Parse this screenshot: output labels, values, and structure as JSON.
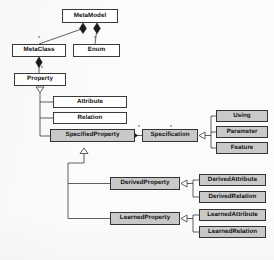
{
  "diagram": {
    "type": "uml-class-diagram",
    "background_color": "#fbfbfb",
    "node_fill_white": "#ffffff",
    "node_fill_gray": "#c9c9c9",
    "line_color": "#3a3a3a",
    "nodes": [
      {
        "id": "metamodel",
        "label": "MetaModel",
        "fill": "white",
        "x": 62,
        "y": 9,
        "w": 56,
        "h": 14
      },
      {
        "id": "metaclass",
        "label": "MetaClass",
        "fill": "white",
        "x": 12,
        "y": 44,
        "w": 54,
        "h": 13
      },
      {
        "id": "enum",
        "label": "Enum",
        "fill": "white",
        "x": 73,
        "y": 44,
        "w": 47,
        "h": 13
      },
      {
        "id": "property",
        "label": "Property",
        "fill": "white",
        "x": 14,
        "y": 73,
        "w": 52,
        "h": 13
      },
      {
        "id": "attribute",
        "label": "Attribute",
        "fill": "white",
        "x": 53,
        "y": 96,
        "w": 74,
        "h": 12
      },
      {
        "id": "relation",
        "label": "Relation",
        "fill": "white",
        "x": 53,
        "y": 112,
        "w": 74,
        "h": 12
      },
      {
        "id": "specifiedproperty",
        "label": "SpecifiedProperty",
        "fill": "gray",
        "x": 50,
        "y": 129,
        "w": 85,
        "h": 13
      },
      {
        "id": "specification",
        "label": "Specification",
        "fill": "gray",
        "x": 142,
        "y": 129,
        "w": 56,
        "h": 13
      },
      {
        "id": "using",
        "label": "Using",
        "fill": "gray",
        "x": 216,
        "y": 110,
        "w": 52,
        "h": 12
      },
      {
        "id": "parameter",
        "label": "Parameter",
        "fill": "gray",
        "x": 216,
        "y": 126,
        "w": 52,
        "h": 12
      },
      {
        "id": "feature",
        "label": "Feature",
        "fill": "gray",
        "x": 216,
        "y": 142,
        "w": 52,
        "h": 12
      },
      {
        "id": "derivedproperty",
        "label": "DerivedProperty",
        "fill": "gray",
        "x": 110,
        "y": 177,
        "w": 70,
        "h": 13
      },
      {
        "id": "derivedattribute",
        "label": "DerivedAttribute",
        "fill": "gray",
        "x": 199,
        "y": 174,
        "w": 67,
        "h": 12
      },
      {
        "id": "derivedrelation",
        "label": "DerivedRelation",
        "fill": "gray",
        "x": 199,
        "y": 191,
        "w": 67,
        "h": 12
      },
      {
        "id": "learnedproperty",
        "label": "LearnedProperty",
        "fill": "gray",
        "x": 110,
        "y": 212,
        "w": 70,
        "h": 13
      },
      {
        "id": "learnedattribute",
        "label": "LearnedAttribute",
        "fill": "gray",
        "x": 199,
        "y": 209,
        "w": 67,
        "h": 12
      },
      {
        "id": "learnedrelation",
        "label": "LearnedRelation",
        "fill": "gray",
        "x": 199,
        "y": 226,
        "w": 67,
        "h": 12
      }
    ],
    "multiplicities": [
      {
        "id": "m-metaclass",
        "label": "*",
        "x": 38,
        "y": 35
      },
      {
        "id": "m-enum",
        "label": "*",
        "x": 94,
        "y": 35
      },
      {
        "id": "m-property",
        "label": "*",
        "x": 41,
        "y": 65
      },
      {
        "id": "m-specprop",
        "label": "*",
        "x": 138,
        "y": 124
      },
      {
        "id": "m-spec",
        "label": "*",
        "x": 170,
        "y": 124
      }
    ],
    "relations": [
      {
        "id": "r1",
        "kind": "composition",
        "from": "metamodel",
        "to": "metaclass"
      },
      {
        "id": "r2",
        "kind": "composition",
        "from": "metamodel",
        "to": "enum"
      },
      {
        "id": "r3",
        "kind": "composition",
        "from": "metaclass",
        "to": "property"
      },
      {
        "id": "r4",
        "kind": "generalization",
        "from": "attribute",
        "to": "property"
      },
      {
        "id": "r5",
        "kind": "generalization",
        "from": "relation",
        "to": "property"
      },
      {
        "id": "r6",
        "kind": "generalization",
        "from": "specifiedproperty",
        "to": "property"
      },
      {
        "id": "r7",
        "kind": "association",
        "from": "specifiedproperty",
        "to": "specification"
      },
      {
        "id": "r8",
        "kind": "generalization",
        "from": "using",
        "to": "specification"
      },
      {
        "id": "r9",
        "kind": "generalization",
        "from": "parameter",
        "to": "specification"
      },
      {
        "id": "r10",
        "kind": "generalization",
        "from": "feature",
        "to": "specification"
      },
      {
        "id": "r11",
        "kind": "generalization",
        "from": "derivedproperty",
        "to": "specifiedproperty"
      },
      {
        "id": "r12",
        "kind": "generalization",
        "from": "learnedproperty",
        "to": "specifiedproperty"
      },
      {
        "id": "r13",
        "kind": "generalization",
        "from": "derivedattribute",
        "to": "derivedproperty"
      },
      {
        "id": "r14",
        "kind": "generalization",
        "from": "derivedrelation",
        "to": "derivedproperty"
      },
      {
        "id": "r15",
        "kind": "generalization",
        "from": "learnedattribute",
        "to": "learnedproperty"
      },
      {
        "id": "r16",
        "kind": "generalization",
        "from": "learnedrelation",
        "to": "learnedproperty"
      }
    ]
  }
}
